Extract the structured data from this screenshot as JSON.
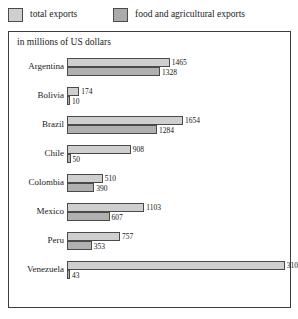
{
  "legend": {
    "entries": [
      {
        "label": "total exports",
        "key": "total",
        "color": "#cfcfcf",
        "icon": "legend-swatch-icon"
      },
      {
        "label": "food and agricultural exports",
        "key": "food",
        "color": "#aaaaaa",
        "icon": "legend-swatch-icon"
      }
    ]
  },
  "chart": {
    "subtitle": "in millions of US dollars",
    "frame_color": "#3c3c3c"
  },
  "chart_data": {
    "type": "bar",
    "orientation": "horizontal",
    "title": "",
    "subtitle": "in millions of US dollars",
    "xlabel": "",
    "ylabel": "",
    "unit": "millions of US dollars",
    "grid": false,
    "legend_position": "top",
    "xlim": [
      0,
      3108
    ],
    "categories": [
      "Argentina",
      "Bolivia",
      "Brazil",
      "Chile",
      "Colombia",
      "Mexico",
      "Peru",
      "Venezuela"
    ],
    "series": [
      {
        "name": "total exports",
        "color": "#cfcfcf",
        "values": [
          1465,
          174,
          1654,
          908,
          510,
          1103,
          757,
          3108
        ]
      },
      {
        "name": "food and agricultural exports",
        "color": "#b0b0b0",
        "values": [
          1328,
          10,
          1284,
          50,
          390,
          607,
          353,
          43
        ]
      }
    ],
    "data_labels": [
      {
        "category": "Argentina",
        "total": "1465",
        "food": "1328"
      },
      {
        "category": "Bolivia",
        "total": "174",
        "food": "10"
      },
      {
        "category": "Brazil",
        "total": "1654",
        "food": "1284"
      },
      {
        "category": "Chile",
        "total": "908",
        "food": "50"
      },
      {
        "category": "Colombia",
        "total": "510",
        "food": "390"
      },
      {
        "category": "Mexico",
        "total": "1103",
        "food": "607"
      },
      {
        "category": "Peru",
        "total": "757",
        "food": "353"
      },
      {
        "category": "Venezuela",
        "total": "3108",
        "food": "43"
      }
    ]
  },
  "scale": {
    "px_per_unit": 0.0701,
    "row_pitch": 29,
    "first_row_top": 2
  }
}
